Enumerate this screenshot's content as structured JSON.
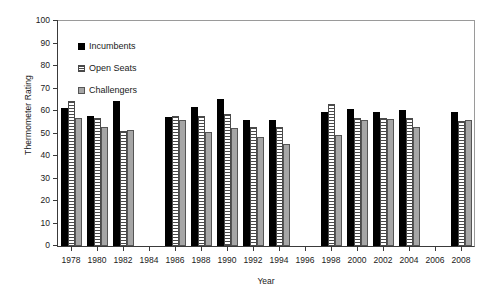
{
  "chart_data": {
    "type": "bar",
    "title": "",
    "xlabel": "Year",
    "ylabel": "Thermometer Rating",
    "ylim": [
      0,
      100
    ],
    "ytick_step": 10,
    "yticks": [
      0,
      10,
      20,
      30,
      40,
      50,
      60,
      70,
      80,
      90,
      100
    ],
    "grid": false,
    "legend_position": "top-left",
    "categories": [
      1978,
      1980,
      1982,
      1984,
      1986,
      1988,
      1990,
      1992,
      1994,
      1996,
      1998,
      2000,
      2002,
      2004,
      2006,
      2008
    ],
    "series": [
      {
        "name": "Incumbents",
        "color": "#000000",
        "fill": "solid-black",
        "values": [
          61.5,
          58.0,
          64.5,
          null,
          57.5,
          62.0,
          65.5,
          56.0,
          56.0,
          null,
          59.5,
          61.0,
          59.5,
          60.5,
          null,
          59.5
        ]
      },
      {
        "name": "Open Seats",
        "color": "#4a4a4a",
        "fill": "horizontal-stripes",
        "values": [
          64.5,
          57.0,
          51.0,
          null,
          58.0,
          58.0,
          58.5,
          53.0,
          53.0,
          null,
          63.0,
          57.0,
          57.0,
          57.0,
          null,
          55.5
        ]
      },
      {
        "name": "Challengers",
        "color": "#a6a6a6",
        "fill": "solid-gray",
        "values": [
          57.0,
          53.0,
          51.5,
          null,
          56.0,
          50.5,
          52.5,
          48.5,
          45.5,
          null,
          49.5,
          56.0,
          56.5,
          53.0,
          null,
          56.0
        ]
      }
    ]
  },
  "legend": {
    "items": [
      {
        "label": "Incumbents",
        "key": "incumbents"
      },
      {
        "label": "Open Seats",
        "key": "open"
      },
      {
        "label": "Challengers",
        "key": "challengers"
      }
    ]
  }
}
